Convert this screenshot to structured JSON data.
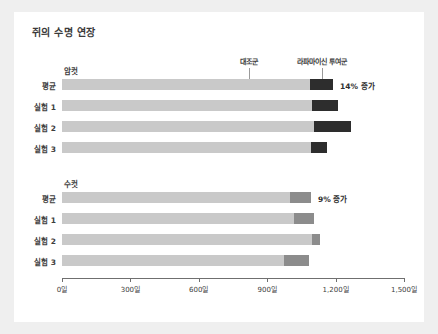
{
  "card": {
    "title": "쥐의 수명 연장"
  },
  "legend": {
    "control": "대조군",
    "treated": "라파마이신 투여군"
  },
  "chart_data": {
    "type": "bar",
    "orientation": "horizontal",
    "stacked": true,
    "title": "쥐의 수명 연장",
    "xlabel": "",
    "ylabel": "",
    "xlim": [
      0,
      1500
    ],
    "xticks": [
      0,
      300,
      600,
      900,
      1200,
      1500
    ],
    "xtick_labels": [
      "0일",
      "300일",
      "600일",
      "900일",
      "1,200일",
      "1,500일"
    ],
    "grid": false,
    "legend_position": "top-callout",
    "unit": "일",
    "colors": {
      "control": "#c9c9c9",
      "treated_female": "#2d2d2d",
      "treated_male": "#8c8c8c",
      "axis": "#6f6f6f",
      "text": "#3d3d3d",
      "card_background": "#ffffff",
      "page_background": "#efefef"
    },
    "series": [
      {
        "name": "대조군",
        "key": "control"
      },
      {
        "name": "라파마이신 투여군",
        "key": "treated"
      }
    ],
    "groups": [
      {
        "name": "암컷",
        "annotation": "14% 증가",
        "categories": [
          "평균",
          "실험 1",
          "실험 2",
          "실험 3"
        ],
        "control_values": [
          1088,
          1096,
          1105,
          1092
        ],
        "total_values": [
          1189,
          1211,
          1267,
          1162
        ],
        "treated_increase_percent": 14
      },
      {
        "name": "수컷",
        "annotation": "9% 증가",
        "categories": [
          "평균",
          "실험 1",
          "실험 2",
          "실험 3"
        ],
        "control_values": [
          1000,
          1017,
          1096,
          974
        ],
        "total_values": [
          1092,
          1105,
          1131,
          1083
        ],
        "treated_increase_percent": 9
      }
    ]
  }
}
